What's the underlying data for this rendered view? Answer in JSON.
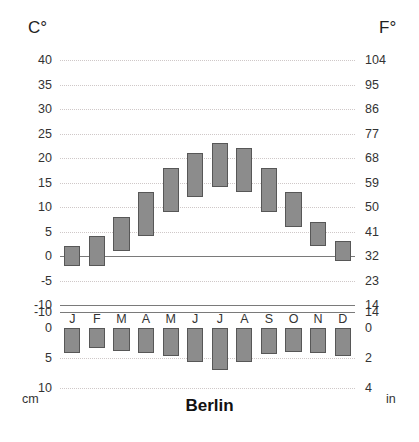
{
  "axes": {
    "celsius_unit": "C°",
    "fahrenheit_unit": "F°",
    "precip_unit_left": "cm",
    "precip_unit_right": "in",
    "celsius_ticks": [
      "40",
      "35",
      "30",
      "25",
      "20",
      "15",
      "10",
      "5",
      "0",
      "-5",
      "-10"
    ],
    "fahrenheit_ticks": [
      "104",
      "95",
      "86",
      "77",
      "68",
      "59",
      "50",
      "41",
      "32",
      "23",
      "14"
    ],
    "precip_ticks_cm": [
      "0",
      "5",
      "10"
    ],
    "precip_ticks_in": [
      "0",
      "2",
      "4"
    ]
  },
  "title": "Berlin",
  "chart_data": {
    "type": "bar",
    "title": "Berlin",
    "subtitle": "",
    "xlabel": "",
    "ylabel": "Temperature (C°) / Precipitation (cm)",
    "grid": true,
    "legend": "none",
    "categories": [
      "J",
      "F",
      "M",
      "A",
      "M",
      "J",
      "J",
      "A",
      "S",
      "O",
      "N",
      "D"
    ],
    "month_names": [
      "January",
      "February",
      "March",
      "April",
      "May",
      "June",
      "July",
      "August",
      "September",
      "October",
      "November",
      "December"
    ],
    "temperature": {
      "unit_primary": "C°",
      "unit_secondary": "F°",
      "ylim_c": [
        -10,
        40
      ],
      "ylim_f": [
        14,
        104
      ],
      "yticks_c": [
        40,
        35,
        30,
        25,
        20,
        15,
        10,
        5,
        0,
        -5,
        -10
      ],
      "yticks_f": [
        104,
        95,
        86,
        77,
        68,
        59,
        50,
        41,
        32,
        23,
        14
      ],
      "low_c": [
        -2,
        -2,
        1,
        4,
        9,
        12,
        14,
        13,
        9,
        6,
        2,
        -1
      ],
      "high_c": [
        2,
        4,
        8,
        13,
        18,
        21,
        23,
        22,
        18,
        13,
        7,
        3
      ],
      "zero_line_c": 0
    },
    "precipitation": {
      "unit_primary": "cm",
      "unit_secondary": "in",
      "ylim_cm": [
        0,
        10
      ],
      "yticks_cm": [
        0,
        5,
        10
      ],
      "yticks_in": [
        0,
        2,
        4
      ],
      "direction": "downward",
      "values_cm": [
        4.2,
        3.4,
        3.8,
        4.2,
        4.6,
        5.6,
        7.0,
        5.6,
        4.4,
        4.0,
        4.2,
        4.6
      ]
    }
  },
  "colors": {
    "bar_fill": "#8c8c8c",
    "bar_border": "#575757",
    "gridline": "#cfc8c8",
    "axis_line": "#7a7a7a",
    "text": "#333333",
    "background": "#ffffff"
  }
}
